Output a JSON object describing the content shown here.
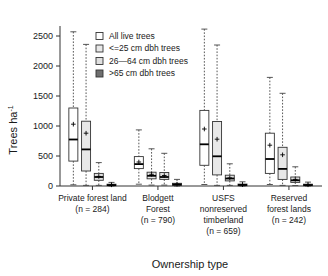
{
  "chart_data": {
    "type": "box",
    "title": "",
    "xlabel": "Ownership type",
    "ylabel": "Trees ha-1",
    "ylabel_display": "Trees ha",
    "ylabel_sup": "-1",
    "ylim": [
      0,
      2600
    ],
    "yticks": [
      0,
      500,
      1000,
      1500,
      2000,
      2500
    ],
    "ytick_labels": [
      "0",
      "500",
      "1000",
      "1500",
      "2000",
      "2500"
    ],
    "grid": false,
    "legend_position": "top-left-inside",
    "categories": [
      {
        "label_lines": [
          "Private forest land",
          "(n = 284)"
        ]
      },
      {
        "label_lines": [
          "Blodgett",
          "Forest",
          "(n = 790)"
        ]
      },
      {
        "label_lines": [
          "USFS",
          "nonreserved",
          "timberland",
          "(n = 659)"
        ]
      },
      {
        "label_lines": [
          "Reserved",
          "forest lands",
          "(n = 242)"
        ]
      }
    ],
    "series": [
      {
        "name": "All live trees",
        "fill": "#ffffff",
        "boxes": [
          {
            "category": "Private forest land",
            "lower_whisker": 20,
            "q1": 415,
            "median": 775,
            "q3": 1300,
            "upper_whisker": 2570,
            "mean": 1030
          },
          {
            "category": "Blodgett Forest",
            "lower_whisker": 30,
            "q1": 290,
            "median": 365,
            "q3": 490,
            "upper_whisker": 935,
            "mean": 400
          },
          {
            "category": "USFS nonreserved timberland",
            "lower_whisker": 25,
            "q1": 345,
            "median": 695,
            "q3": 1260,
            "upper_whisker": 2615,
            "mean": 950
          },
          {
            "category": "Reserved forest lands",
            "lower_whisker": 25,
            "q1": 210,
            "median": 450,
            "q3": 880,
            "upper_whisker": 1810,
            "mean": 680
          }
        ]
      },
      {
        "name": "<=25 cm dbh trees",
        "fill": "#e8e8e8",
        "boxes": [
          {
            "category": "Private forest land",
            "lower_whisker": 10,
            "q1": 250,
            "median": 610,
            "q3": 1080,
            "upper_whisker": 2360,
            "mean": 880
          },
          {
            "category": "Blodgett Forest",
            "lower_whisker": 15,
            "q1": 120,
            "median": 170,
            "q3": 230,
            "upper_whisker": 620,
            "mean": 195
          },
          {
            "category": "USFS nonreserved timberland",
            "lower_whisker": 10,
            "q1": 185,
            "median": 495,
            "q3": 1075,
            "upper_whisker": 2350,
            "mean": 780
          },
          {
            "category": "Reserved forest lands",
            "lower_whisker": 10,
            "q1": 110,
            "median": 285,
            "q3": 645,
            "upper_whisker": 1545,
            "mean": 520
          }
        ]
      },
      {
        "name": "26-64 cm dbh trees",
        "fill": "#e0e0e0",
        "boxes": [
          {
            "category": "Private forest land",
            "lower_whisker": 10,
            "q1": 95,
            "median": 150,
            "q3": 210,
            "upper_whisker": 390,
            "mean": 160
          },
          {
            "category": "Blodgett Forest",
            "lower_whisker": 15,
            "q1": 110,
            "median": 150,
            "q3": 225,
            "upper_whisker": 545,
            "mean": 175
          },
          {
            "category": "USFS nonreserved timberland",
            "lower_whisker": 10,
            "q1": 85,
            "median": 125,
            "q3": 180,
            "upper_whisker": 370,
            "mean": 135
          },
          {
            "category": "Reserved forest lands",
            "lower_whisker": 8,
            "q1": 60,
            "median": 95,
            "q3": 150,
            "upper_whisker": 320,
            "mean": 110
          }
        ]
      },
      {
        "name": ">65 cm dbh trees",
        "fill": "#6f6f6f",
        "boxes": [
          {
            "category": "Private forest land",
            "lower_whisker": 0,
            "q1": 5,
            "median": 15,
            "q3": 30,
            "upper_whisker": 60,
            "mean": 20
          },
          {
            "category": "Blodgett Forest",
            "lower_whisker": 0,
            "q1": 10,
            "median": 25,
            "q3": 45,
            "upper_whisker": 110,
            "mean": 30
          },
          {
            "category": "USFS nonreserved timberland",
            "lower_whisker": 0,
            "q1": 5,
            "median": 18,
            "q3": 32,
            "upper_whisker": 70,
            "mean": 22
          },
          {
            "category": "Reserved forest lands",
            "lower_whisker": 0,
            "q1": 5,
            "median": 16,
            "q3": 30,
            "upper_whisker": 65,
            "mean": 20
          }
        ]
      }
    ]
  },
  "legend": {
    "items": [
      {
        "label": "All live trees",
        "swatch": "#ffffff"
      },
      {
        "label": "<=25 cm dbh trees",
        "swatch": "#e8e8e8"
      },
      {
        "label": "26—64 cm dbh trees",
        "swatch": "#e0e0e0"
      },
      {
        "label": ">65 cm dbh trees",
        "swatch": "#6f6f6f"
      }
    ]
  },
  "colors": {
    "axis": "#333333",
    "text": "#1a1a1a",
    "whisker": "#444444",
    "background": "#ffffff"
  }
}
